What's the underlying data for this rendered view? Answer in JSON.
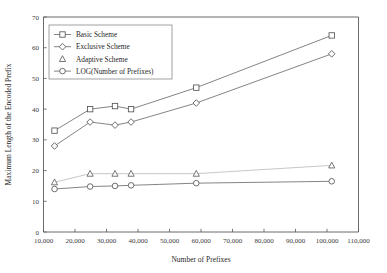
{
  "chart_data": {
    "type": "line",
    "title": "",
    "xlabel": "Number of Prefixes",
    "ylabel": "Maximum Length of the Encoded Prefix",
    "xlim": [
      10000,
      110000
    ],
    "ylim": [
      0,
      70
    ],
    "xticks": [
      10000,
      20000,
      30000,
      40000,
      50000,
      60000,
      70000,
      80000,
      90000,
      100000,
      110000
    ],
    "xtick_labels": [
      "10,000",
      "20,000",
      "30,000",
      "40,000",
      "50,000",
      "60,000",
      "70,000",
      "80,000",
      "90,000",
      "100,000",
      "110,000"
    ],
    "yticks": [
      0,
      10,
      20,
      30,
      40,
      50,
      60,
      70
    ],
    "ytick_labels": [
      "0",
      "10",
      "20",
      "30",
      "40",
      "50",
      "60",
      "70"
    ],
    "grid": false,
    "legend_position": "upper-left",
    "x": [
      13500,
      24800,
      32700,
      37800,
      58500,
      101500
    ],
    "series": [
      {
        "name": "Basic Scheme",
        "marker": "square",
        "line": true,
        "values": [
          33,
          40,
          41,
          40,
          47,
          64
        ]
      },
      {
        "name": "Exclusive Scheme",
        "marker": "diamond",
        "line": true,
        "values": [
          28,
          35.8,
          34.8,
          35.8,
          42,
          58
        ]
      },
      {
        "name": "Adaptive Scheme",
        "marker": "triangle",
        "line": true,
        "values": [
          16.2,
          19,
          19,
          19,
          19,
          21.7
        ]
      },
      {
        "name": "LOG(Number of Prefixes)",
        "marker": "circle",
        "line": true,
        "values": [
          14,
          14.8,
          15,
          15.2,
          15.9,
          16.5
        ]
      }
    ],
    "colors": {
      "line": "#6e6e6e",
      "faint_line": "#b9b9b9",
      "marker_stroke": "#555555",
      "marker_fill": "#ffffff",
      "axis": "#5a5a5a",
      "text": "#1f1f1f",
      "background": "#ffffff"
    }
  },
  "legend": {
    "items": [
      {
        "label": "Basic Scheme",
        "marker": "square"
      },
      {
        "label": "Exclusive Scheme",
        "marker": "diamond"
      },
      {
        "label": "Adaptive Scheme",
        "marker": "triangle"
      },
      {
        "label": "LOG(Number of Prefixes)",
        "marker": "circle"
      }
    ]
  }
}
